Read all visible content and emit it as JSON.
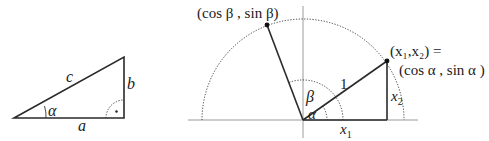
{
  "figure": {
    "left_triangle": {
      "hypotenuse_label": "c",
      "opposite_label": "b",
      "adjacent_label": "a",
      "angle_label": "α"
    },
    "unit_circle": {
      "beta_point_label": "(cos β , sin β)",
      "alpha_point_label_line1": "(x₁,x₂) =",
      "alpha_point_label_line2": "(cos α , sin α )",
      "radius_label": "1",
      "beta_angle_label": "β",
      "alpha_angle_label": "α",
      "x1_label": "x",
      "x1_sub": "1",
      "x2_label": "x",
      "x2_sub": "2"
    }
  }
}
